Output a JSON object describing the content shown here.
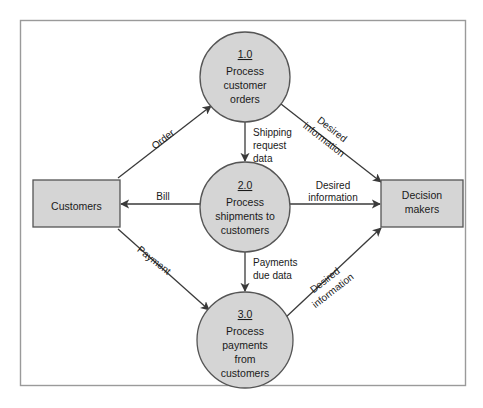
{
  "diagram": {
    "frame": {
      "border_color": "#9a9a9a",
      "background": "#ffffff"
    },
    "style": {
      "shape_fill": "#d5d5d5",
      "shape_stroke": "#555555",
      "line_color": "#3a3a3a",
      "text_color": "#1a1a1a"
    },
    "entities": [
      {
        "id": "customers",
        "label": "Customers",
        "shape": "rectangle",
        "x": 33,
        "y": 180,
        "width": 87,
        "height": 47
      },
      {
        "id": "decision-makers",
        "label_line1": "Decision",
        "label_line2": "makers",
        "shape": "rectangle",
        "x": 381,
        "y": 180,
        "width": 82,
        "height": 47
      }
    ],
    "processes": [
      {
        "id": "process-1",
        "number": "1.0",
        "lines": [
          "Process",
          "customer",
          "orders"
        ],
        "cx": 245,
        "cy": 77,
        "r": 45
      },
      {
        "id": "process-2",
        "number": "2.0",
        "lines": [
          "Process",
          "shipments to",
          "customers"
        ],
        "cx": 245,
        "cy": 207,
        "r": 45
      },
      {
        "id": "process-3",
        "number": "3.0",
        "lines": [
          "Process",
          "payments",
          "from",
          "customers"
        ],
        "cx": 245,
        "cy": 340,
        "r": 48
      }
    ],
    "flows": [
      {
        "id": "flow-order",
        "label_lines": [
          "Order"
        ],
        "from": "customers",
        "to": "process-1",
        "rotation": -38,
        "label_x": 165,
        "label_y": 142
      },
      {
        "id": "flow-desired-info-top",
        "label_lines": [
          "Desired",
          "information"
        ],
        "from": "process-1",
        "to": "decision-makers",
        "rotation": 38,
        "label_x": 330,
        "label_y": 132
      },
      {
        "id": "flow-shipping-request-data",
        "label_lines": [
          "Shipping",
          "request",
          "data"
        ],
        "from": "process-1",
        "to": "process-2",
        "rotation": 0,
        "label_x": 253,
        "label_y": 132
      },
      {
        "id": "flow-bill",
        "label_lines": [
          "Bill"
        ],
        "from": "process-2",
        "to": "customers",
        "rotation": 0,
        "label_x": 163,
        "label_y": 198
      },
      {
        "id": "flow-desired-info-middle",
        "label_lines": [
          "Desired",
          "information"
        ],
        "from": "process-2",
        "to": "decision-makers",
        "rotation": 0,
        "label_x": 333,
        "label_y": 188
      },
      {
        "id": "flow-payment",
        "label_lines": [
          "Payment"
        ],
        "from": "customers",
        "to": "process-3",
        "rotation": 38,
        "label_x": 148,
        "label_y": 262
      },
      {
        "id": "flow-payments-due-data",
        "label_lines": [
          "Payments",
          "due data"
        ],
        "from": "process-2",
        "to": "process-3",
        "rotation": 0,
        "label_x": 253,
        "label_y": 265
      },
      {
        "id": "flow-desired-info-bottom",
        "label_lines": [
          "Desired",
          "information"
        ],
        "from": "process-3",
        "to": "decision-makers",
        "rotation": -38,
        "label_x": 322,
        "label_y": 283
      }
    ]
  }
}
